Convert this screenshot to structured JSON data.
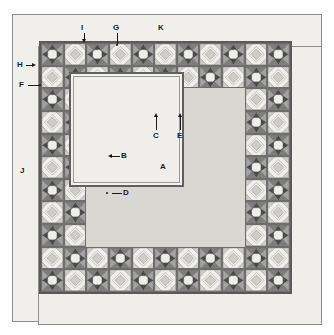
{
  "diagram": {
    "type": "quilt-construction-diagram",
    "title": "",
    "palette": {
      "page_background": "#ffffff",
      "paper": "#f0efeb",
      "border_band": "#efeeea",
      "frame_line": "#8d8d8d",
      "patch_outline": "#6e6e6e",
      "dark": "#4a4a4a",
      "mid_dark": "#7d7d7d",
      "mid": "#a3a3a3",
      "light": "#cfcdc8",
      "lightest": "#efeeea",
      "label_color": "#1a1a1a"
    },
    "geometry": {
      "grid_columns": 11,
      "grid_rows": 11,
      "center_hole_span": 7,
      "patch_field_px": 253
    },
    "labels": [
      {
        "id": "A",
        "text": "A",
        "role": "centre-panel",
        "x": 163,
        "y": 167,
        "leader": "none"
      },
      {
        "id": "B",
        "text": "B",
        "role": "inner-border-strip-left",
        "x": 122,
        "y": 156,
        "leader": "left-arrow"
      },
      {
        "id": "C",
        "text": "C",
        "role": "inner-border-corner-unit",
        "x": 156,
        "y": 130,
        "leader": "up-arrow"
      },
      {
        "id": "D",
        "text": "D",
        "role": "inner-border-seam",
        "x": 124,
        "y": 193,
        "leader": "left-arrow"
      },
      {
        "id": "E",
        "text": "E",
        "role": "inner-border-sashing",
        "x": 180,
        "y": 130,
        "leader": "up-arrow"
      },
      {
        "id": "F",
        "text": "F",
        "role": "pieced-border-edge",
        "x": 21,
        "y": 85,
        "leader": "right-line"
      },
      {
        "id": "G",
        "text": "G",
        "role": "pieced-block-top",
        "x": 115,
        "y": 28,
        "leader": "down-line"
      },
      {
        "id": "H",
        "text": "H",
        "role": "outer-binding-left",
        "x": 19,
        "y": 65,
        "leader": "right-arrow"
      },
      {
        "id": "I",
        "text": "I",
        "role": "pieced-border-top-seam",
        "x": 83,
        "y": 28,
        "leader": "down-arrow"
      },
      {
        "id": "J",
        "text": "J",
        "role": "outer-plain-border",
        "x": 22,
        "y": 171,
        "leader": "none"
      },
      {
        "id": "K",
        "text": "K",
        "role": "outer-border-top",
        "x": 160,
        "y": 28,
        "leader": "none"
      }
    ]
  }
}
